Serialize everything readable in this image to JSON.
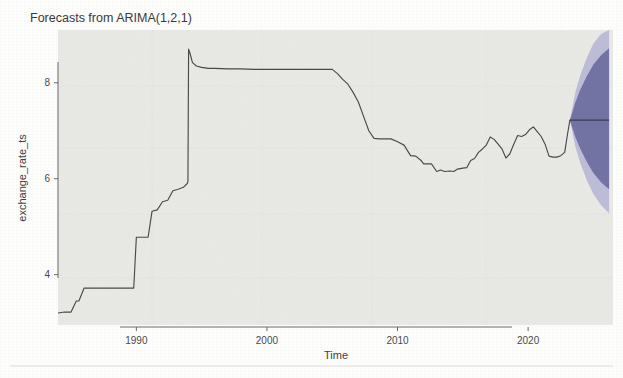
{
  "figure": {
    "title": "Forecasts from ARIMA(1,2,1)",
    "xlabel": "Time",
    "ylabel": "exchange_rate_ts"
  },
  "colors": {
    "series_line": "#4a4a48",
    "forecast_line": "#3a3a52",
    "pi_80": "#6f6fa0",
    "pi_95": "#b9b9d6",
    "panel_bg": "#e9e9e6",
    "axis": "#5a5a58",
    "text": "#3a3a3a"
  },
  "axes": {
    "x_ticks": [
      "1990",
      "2000",
      "2010",
      "2020"
    ],
    "x_tick_values": [
      1990,
      2000,
      2010,
      2020
    ],
    "y_ticks": [
      "4",
      "6",
      "8"
    ],
    "y_tick_values": [
      4,
      6,
      8
    ],
    "xlim": [
      1984.0,
      2026.5
    ],
    "ylim": [
      2.95,
      9.1
    ],
    "grid": false
  },
  "chart_data": {
    "type": "line",
    "title": "Forecasts from ARIMA(1,2,1)",
    "xlabel": "Time",
    "ylabel": "exchange_rate_ts",
    "xlim": [
      1984.0,
      2026.5
    ],
    "ylim": [
      2.95,
      9.1
    ],
    "grid": false,
    "legend": "none",
    "annotations": [
      "Historical series shows a pegged/stepwise regime before 1994",
      "Sharp devaluation jump to ~8.7 in early 1994",
      "Flat peg near 8.28 from 1995 to 2005",
      "Gradual appreciation to ~6.1 trough around 2013-2014",
      "Volatile range 6.3-7.1 from 2015 to 2023",
      "ARIMA(1,2,1) forecast is flat near 7.22 with widening fan"
    ],
    "series": [
      {
        "name": "exchange_rate_ts",
        "kind": "historical",
        "color": "#4a4a48",
        "x": [
          1984.0,
          1984.5,
          1985.0,
          1985.4,
          1985.6,
          1986.0,
          1986.4,
          1986.6,
          1986.9,
          1987.2,
          1987.6,
          1988.0,
          1988.5,
          1989.0,
          1989.4,
          1989.8,
          1990.0,
          1990.3,
          1990.6,
          1990.9,
          1991.2,
          1991.6,
          1992.0,
          1992.4,
          1992.8,
          1993.2,
          1993.6,
          1993.9,
          1993.95,
          1994.0,
          1994.1,
          1994.3,
          1994.6,
          1995.0,
          1995.5,
          1996.0,
          1997.0,
          1998.0,
          1999.0,
          2000.0,
          2001.0,
          2002.0,
          2003.0,
          2004.0,
          2005.0,
          2005.4,
          2005.8,
          2006.2,
          2006.6,
          2007.0,
          2007.4,
          2007.8,
          2008.2,
          2008.6,
          2009.0,
          2009.5,
          2010.0,
          2010.5,
          2011.0,
          2011.4,
          2011.8,
          2012.0,
          2012.3,
          2012.6,
          2013.0,
          2013.3,
          2013.6,
          2014.0,
          2014.3,
          2014.6,
          2015.0,
          2015.3,
          2015.6,
          2015.9,
          2016.2,
          2016.5,
          2016.8,
          2017.1,
          2017.4,
          2017.7,
          2018.0,
          2018.3,
          2018.6,
          2018.9,
          2019.2,
          2019.5,
          2019.8,
          2020.1,
          2020.4,
          2020.7,
          2021.0,
          2021.3,
          2021.6,
          2021.9,
          2022.2,
          2022.5,
          2022.8,
          2023.0,
          2023.2
        ],
        "y": [
          3.2,
          3.22,
          3.22,
          3.45,
          3.45,
          3.72,
          3.72,
          3.72,
          3.72,
          3.72,
          3.72,
          3.72,
          3.72,
          3.72,
          3.72,
          3.72,
          4.78,
          4.78,
          4.78,
          4.78,
          5.32,
          5.35,
          5.52,
          5.55,
          5.75,
          5.78,
          5.82,
          5.9,
          5.95,
          8.7,
          8.62,
          8.42,
          8.35,
          8.32,
          8.3,
          8.3,
          8.29,
          8.29,
          8.28,
          8.28,
          8.28,
          8.28,
          8.28,
          8.28,
          8.28,
          8.19,
          8.07,
          7.97,
          7.8,
          7.6,
          7.3,
          7.0,
          6.84,
          6.83,
          6.83,
          6.83,
          6.77,
          6.7,
          6.48,
          6.47,
          6.38,
          6.31,
          6.31,
          6.31,
          6.15,
          6.18,
          6.15,
          6.16,
          6.15,
          6.2,
          6.22,
          6.23,
          6.38,
          6.42,
          6.55,
          6.62,
          6.7,
          6.87,
          6.82,
          6.72,
          6.62,
          6.43,
          6.52,
          6.72,
          6.9,
          6.88,
          6.92,
          7.02,
          7.08,
          6.98,
          6.88,
          6.72,
          6.47,
          6.45,
          6.45,
          6.48,
          6.55,
          6.9,
          7.22
        ]
      },
      {
        "name": "point forecast",
        "kind": "forecast",
        "color": "#3a3a52",
        "x": [
          2023.2,
          2024.0,
          2025.0,
          2026.2
        ],
        "y": [
          7.22,
          7.22,
          7.22,
          7.22
        ]
      }
    ],
    "prediction_intervals": [
      {
        "level": 80,
        "color": "#6f6fa0",
        "x": [
          2023.2,
          2023.6,
          2024.0,
          2024.5,
          2025.0,
          2025.6,
          2026.2
        ],
        "lower": [
          7.22,
          6.88,
          6.62,
          6.35,
          6.12,
          5.92,
          5.78
        ],
        "upper": [
          7.22,
          7.58,
          7.86,
          8.14,
          8.38,
          8.58,
          8.72
        ]
      },
      {
        "level": 95,
        "color": "#b9b9d6",
        "x": [
          2023.2,
          2023.6,
          2024.0,
          2024.5,
          2025.0,
          2025.6,
          2026.2
        ],
        "lower": [
          7.22,
          6.68,
          6.32,
          5.96,
          5.68,
          5.44,
          5.28
        ],
        "upper": [
          7.22,
          7.78,
          8.16,
          8.52,
          8.82,
          9.02,
          9.1
        ]
      }
    ]
  }
}
